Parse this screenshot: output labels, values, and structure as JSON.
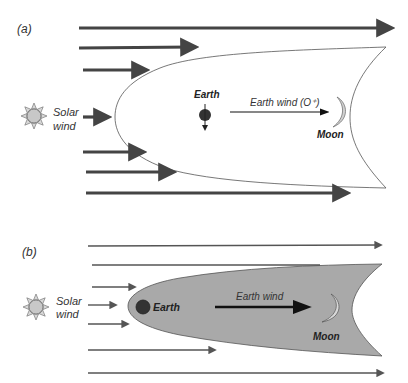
{
  "panels": [
    {
      "id": "a",
      "label": "(a)",
      "solar_wind_label_line1": "Solar",
      "solar_wind_label_line2": "wind",
      "earth_label": "Earth",
      "earth_wind_label": "Earth wind (O⁺)",
      "moon_label": "Moon",
      "magnetosphere_fill": "#ffffff",
      "arrow_color": "#444444"
    },
    {
      "id": "b",
      "label": "(b)",
      "solar_wind_label_line1": "Solar",
      "solar_wind_label_line2": "wind",
      "earth_label": "Earth",
      "earth_wind_label": "Earth wind",
      "moon_label": "Moon",
      "magnetosphere_fill": "#a9a9a9",
      "arrow_color": "#555555"
    }
  ],
  "colors": {
    "sun_fill": "#c8c8c8",
    "sun_stroke": "#555555",
    "earth_fill": "#333333",
    "moon_fill": "#d0d0d0"
  }
}
